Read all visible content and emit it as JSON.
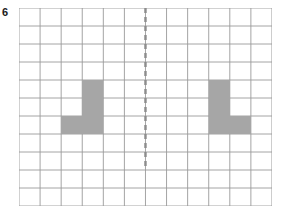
{
  "worksheet": {
    "question_number": "6",
    "grid": {
      "columns": 12,
      "rows": 11,
      "cell_width": 21.08,
      "cell_height": 18.0,
      "origin_x": 19,
      "origin_y": 8,
      "line_color": "#9a9a9a",
      "line_width": 0.9,
      "background": "#ffffff"
    },
    "mirror_line": {
      "orientation": "vertical",
      "column_index": 6,
      "style": "dashed",
      "color": "#8c8c8c",
      "width": 2.4,
      "dash_on": 5,
      "dash_off": 4,
      "start_row": 0,
      "end_row": 9
    },
    "shapes": [
      {
        "name": "left-figure",
        "fill": "#a6a6a6",
        "cells": [
          {
            "col": 3,
            "row": 4
          },
          {
            "col": 3,
            "row": 5
          },
          {
            "col": 3,
            "row": 6
          },
          {
            "col": 2,
            "row": 6
          }
        ]
      },
      {
        "name": "right-figure",
        "fill": "#a6a6a6",
        "cells": [
          {
            "col": 9,
            "row": 4
          },
          {
            "col": 9,
            "row": 5
          },
          {
            "col": 9,
            "row": 6
          },
          {
            "col": 10,
            "row": 6
          }
        ]
      }
    ]
  }
}
